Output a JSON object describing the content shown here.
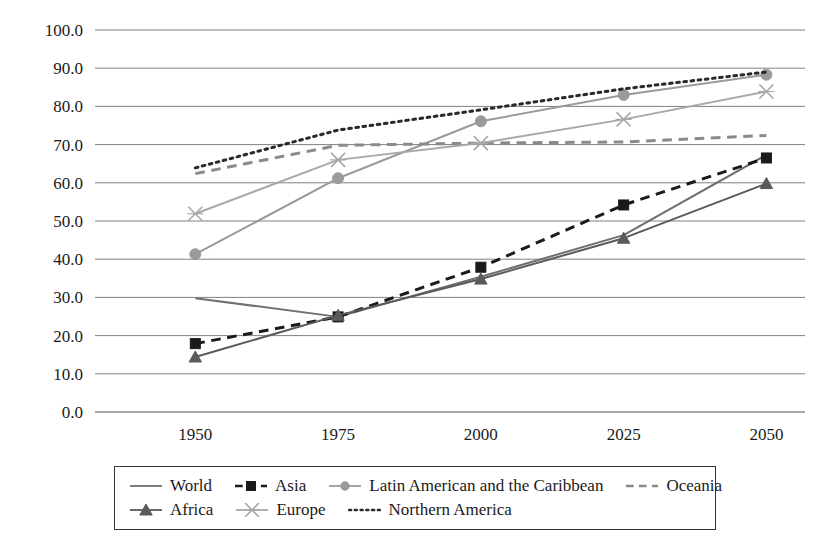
{
  "chart_data": {
    "type": "line",
    "title": "",
    "xlabel": "",
    "ylabel": "",
    "x": [
      1950,
      1975,
      2000,
      2025,
      2050
    ],
    "categories": [
      "1950",
      "1975",
      "2000",
      "2025",
      "2050"
    ],
    "ylim": [
      0.0,
      100.0
    ],
    "ytick_step": 10.0,
    "yticks": [
      "0.0",
      "10.0",
      "20.0",
      "30.0",
      "40.0",
      "50.0",
      "60.0",
      "70.0",
      "80.0",
      "90.0",
      "100.0"
    ],
    "grid": "horizontal",
    "legend_position": "bottom",
    "series": [
      {
        "name": "World",
        "values": [
          29.8,
          24.9,
          35.4,
          46.3,
          67.3
        ],
        "color": "#6f6f6f",
        "line_style": "solid",
        "marker": "none"
      },
      {
        "name": "Asia",
        "values": [
          17.9,
          24.9,
          37.9,
          54.2,
          66.5
        ],
        "color": "#1a1a1a",
        "line_style": "dashed",
        "marker": "square"
      },
      {
        "name": "Latin American and the Caribbean",
        "values": [
          41.3,
          61.2,
          76.1,
          83.0,
          88.3
        ],
        "color": "#9a9a9a",
        "line_style": "solid",
        "marker": "circle"
      },
      {
        "name": "Oceania",
        "values": [
          62.4,
          69.8,
          70.4,
          70.7,
          72.4
        ],
        "color": "#8a8a8a",
        "line_style": "dashed",
        "marker": "none"
      },
      {
        "name": "Africa",
        "values": [
          14.4,
          25.3,
          34.8,
          45.5,
          59.8
        ],
        "color": "#5a5a5a",
        "line_style": "solid",
        "marker": "triangle"
      },
      {
        "name": "Europe",
        "values": [
          51.9,
          66.0,
          70.4,
          76.6,
          83.9
        ],
        "color": "#a8a8a8",
        "line_style": "solid",
        "marker": "cross"
      },
      {
        "name": "Northern America",
        "values": [
          63.9,
          73.8,
          79.1,
          84.6,
          89.0
        ],
        "color": "#2a2a2a",
        "line_style": "dotted",
        "marker": "none"
      }
    ]
  },
  "legend": {
    "rows": [
      [
        "World",
        "Asia",
        "Latin American and the Caribbean",
        "Oceania"
      ],
      [
        "Africa",
        "Europe",
        "Northern America"
      ]
    ]
  }
}
